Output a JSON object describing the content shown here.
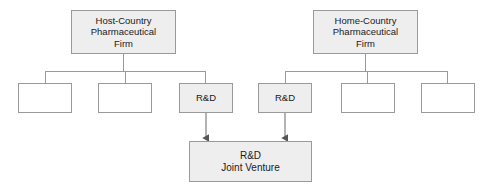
{
  "diagram": {
    "colors": {
      "node_fill_shaded": "#eeeeee",
      "node_fill_plain": "#ffffff",
      "node_border": "#9a9a9a",
      "edge": "#808080",
      "text": "#1a1a1a",
      "background": "#ffffff"
    },
    "parents": [
      {
        "id": "host-country-pharmaceutical-firm",
        "label": "Host-Country\nPharmaceutical\nFirm",
        "fill": "shaded",
        "x": 71,
        "y": 10,
        "w": 105,
        "h": 44
      },
      {
        "id": "home-country-pharmaceutical-firm",
        "label": "Home-Country\nPharmaceutical\nFirm",
        "fill": "shaded",
        "x": 313,
        "y": 10,
        "w": 105,
        "h": 44
      }
    ],
    "children": [
      {
        "id": "host-division-1",
        "label": "",
        "fill": "plain",
        "x": 18,
        "y": 83,
        "w": 54,
        "h": 30,
        "parent": "host-country-pharmaceutical-firm"
      },
      {
        "id": "host-division-2",
        "label": "",
        "fill": "plain",
        "x": 98,
        "y": 83,
        "w": 54,
        "h": 30,
        "parent": "host-country-pharmaceutical-firm"
      },
      {
        "id": "host-rnd",
        "label": "R&D",
        "fill": "shaded",
        "x": 179,
        "y": 83,
        "w": 54,
        "h": 30,
        "parent": "host-country-pharmaceutical-firm"
      },
      {
        "id": "home-rnd",
        "label": "R&D",
        "fill": "shaded",
        "x": 258,
        "y": 83,
        "w": 54,
        "h": 30,
        "parent": "home-country-pharmaceutical-firm"
      },
      {
        "id": "home-division-1",
        "label": "",
        "fill": "plain",
        "x": 341,
        "y": 83,
        "w": 54,
        "h": 30,
        "parent": "home-country-pharmaceutical-firm"
      },
      {
        "id": "home-division-2",
        "label": "",
        "fill": "plain",
        "x": 421,
        "y": 83,
        "w": 54,
        "h": 30,
        "parent": "home-country-pharmaceutical-firm"
      }
    ],
    "joint_venture": {
      "id": "rnd-joint-venture",
      "label": "R&D\nJoint Venture",
      "fill": "shaded",
      "x": 189,
      "y": 141,
      "w": 123,
      "h": 41
    },
    "connectors": {
      "host_bus_y": 71,
      "home_bus_y": 71,
      "host_bus_x1": 45,
      "host_bus_x2": 206,
      "home_bus_x1": 285,
      "home_bus_x2": 448,
      "arrow_from_host_rnd_x": 206,
      "arrow_from_home_rnd_x": 285,
      "arrow_top_y": 113,
      "arrow_tip_y": 140
    }
  }
}
